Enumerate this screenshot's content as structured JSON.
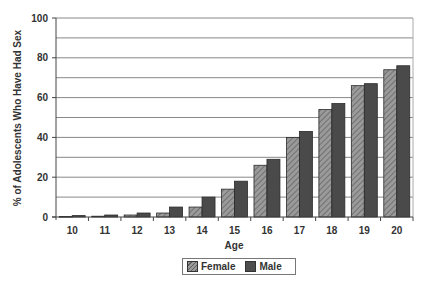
{
  "chart_data": {
    "type": "bar",
    "title": "",
    "xlabel": "Age",
    "ylabel": "% of Adolescents Who Have Had Sex",
    "categories": [
      "10",
      "11",
      "12",
      "13",
      "14",
      "15",
      "16",
      "17",
      "18",
      "19",
      "20"
    ],
    "series": [
      {
        "name": "Female",
        "values": [
          0.3,
          0.4,
          1,
          2,
          5,
          14,
          26,
          40,
          54,
          66,
          74
        ]
      },
      {
        "name": "Male",
        "values": [
          0.7,
          1,
          2,
          5,
          10,
          18,
          29,
          43,
          57,
          67,
          76
        ]
      }
    ],
    "ylim": [
      0,
      100
    ],
    "yticks": [
      0,
      20,
      40,
      60,
      80,
      100
    ],
    "gridlines_every": 10,
    "grid": true,
    "legend_position": "bottom-center",
    "colors": {
      "Female": "#8a8a8a",
      "Male": "#4a4a4a",
      "hatch": "#555555",
      "grid": "#888888"
    }
  },
  "legend": {
    "items": [
      {
        "label": "Female"
      },
      {
        "label": "Male"
      }
    ]
  }
}
